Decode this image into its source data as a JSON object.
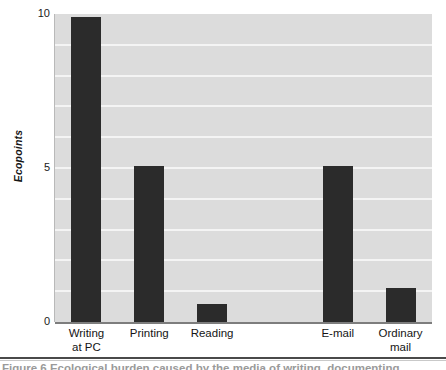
{
  "figure": {
    "caption_clipped": "Figure 6   Ecological burden caused by the media of writing, documenting",
    "background_color": "#ffffff",
    "plot_background_color": "#dcdcdc",
    "gridline_color": "#f4f4f4",
    "bar_color": "#2b2b2b",
    "axis_color": "#7d7d7d"
  },
  "chart_data": {
    "type": "bar",
    "title": "",
    "xlabel": "",
    "ylabel": "Ecopoints",
    "categories": [
      "Writing at PC",
      "Printing",
      "Reading",
      "",
      "E-mail",
      "Ordinary mail"
    ],
    "category_lines": [
      [
        "Writing",
        "at PC"
      ],
      [
        "Printing"
      ],
      [
        "Reading"
      ],
      [
        ""
      ],
      [
        "E-mail"
      ],
      [
        "Ordinary",
        "mail"
      ]
    ],
    "values": [
      9.9,
      5.05,
      0.6,
      null,
      5.05,
      1.1
    ],
    "ylim": [
      0,
      10
    ],
    "ytick_labels": [
      "10",
      "5",
      "0"
    ],
    "ytick_values": [
      10,
      5,
      0
    ],
    "gridline_values": [
      9,
      8,
      7,
      6,
      5,
      4,
      3,
      2,
      1
    ],
    "grid": true,
    "legend": "none"
  }
}
